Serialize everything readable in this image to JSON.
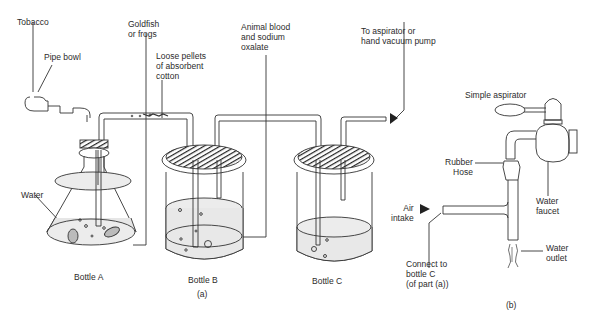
{
  "figure": {
    "part_a": {
      "caption": "(a)",
      "labels": {
        "tobacco": "Tobacco",
        "pipe_bowl": "Pipe bowl",
        "goldfish": "Goldfish\nor frogs",
        "loose_pellets": "Loose pellets\nof absorbent\ncotton",
        "animal_blood": "Animal blood\nand sodium\noxalate",
        "to_aspirator": "To aspirator or\nhand vacuum pump",
        "water": "Water"
      },
      "bottles": [
        {
          "name": "Bottle A"
        },
        {
          "name": "Bottle B"
        },
        {
          "name": "Bottle C"
        }
      ]
    },
    "part_b": {
      "caption": "(b)",
      "labels": {
        "simple_aspirator": "Simple aspirator",
        "rubber_hose": "Rubber\nHose",
        "water_faucet": "Water\nfaucet",
        "air_intake": "Air\nintake",
        "water_outlet": "Water\noutlet",
        "connect_to": "Connect to\nbottle C\n(of part (a))"
      }
    },
    "colors": {
      "line": "#333333",
      "liquid": "#e6e6e6",
      "stopper": "#2a2a2a"
    }
  }
}
